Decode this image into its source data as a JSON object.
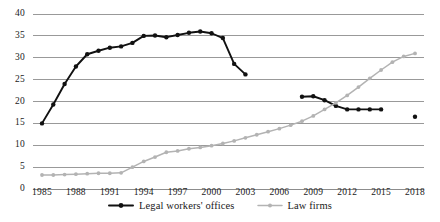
{
  "chart_data": {
    "type": "line",
    "title": "",
    "subtitle": "",
    "xlabel": "",
    "ylabel": "",
    "xlim": [
      1985,
      2018
    ],
    "ylim": [
      0,
      40
    ],
    "grid": "horizontal",
    "legend_position": "bottom-center",
    "y_ticks": [
      0,
      5,
      10,
      15,
      20,
      25,
      30,
      35,
      40
    ],
    "y_tick_labels": [
      "0",
      "5",
      "10",
      "15",
      "20",
      "25",
      "30",
      "35",
      "40"
    ],
    "x_ticks": [
      1985,
      1988,
      1991,
      1994,
      1997,
      2000,
      2003,
      2006,
      2009,
      2012,
      2015,
      2018
    ],
    "x_tick_labels": [
      "1985",
      "1988",
      "1991",
      "1994",
      "1997",
      "2000",
      "2003",
      "2006",
      "2009",
      "2012",
      "2015",
      "2018"
    ],
    "series": [
      {
        "name": "Legal workers' offices",
        "color": "#111111",
        "marker": "circle",
        "segments": [
          {
            "x": [
              1985,
              1986,
              1987,
              1988,
              1989,
              1990,
              1991,
              1992,
              1993,
              1994,
              1995,
              1996,
              1997,
              1998,
              1999,
              2000,
              2001,
              2002,
              2003
            ],
            "y": [
              15.0,
              19.3,
              24.0,
              28.0,
              30.8,
              31.6,
              32.3,
              32.6,
              33.4,
              35.0,
              35.1,
              34.7,
              35.2,
              35.7,
              36.0,
              35.6,
              34.5,
              28.6,
              26.2
            ]
          },
          {
            "x": [
              2008,
              2009,
              2010,
              2011,
              2012,
              2013,
              2014,
              2015
            ],
            "y": [
              21.1,
              21.2,
              20.3,
              19.0,
              18.2,
              18.2,
              18.2,
              18.2
            ]
          },
          {
            "x": [
              2018
            ],
            "y": [
              16.5
            ]
          }
        ]
      },
      {
        "name": "Law firms",
        "color": "#b3b3b3",
        "marker": "circle",
        "segments": [
          {
            "x": [
              1985,
              1986,
              1987,
              1988,
              1989,
              1990,
              1991,
              1992,
              1993,
              1994,
              1995,
              1996,
              1997,
              1998,
              1999,
              2000,
              2001,
              2002,
              2003,
              2004,
              2005,
              2006,
              2007,
              2008,
              2009,
              2010,
              2011,
              2012,
              2013,
              2014,
              2015,
              2016,
              2017,
              2018
            ],
            "y": [
              3.2,
              3.2,
              3.3,
              3.4,
              3.5,
              3.6,
              3.6,
              3.7,
              5.0,
              6.3,
              7.3,
              8.4,
              8.7,
              9.2,
              9.5,
              9.9,
              10.4,
              11.0,
              11.7,
              12.4,
              13.1,
              13.8,
              14.6,
              15.5,
              16.7,
              18.2,
              19.7,
              21.4,
              23.3,
              25.3,
              27.2,
              29.0,
              30.3,
              31.0
            ]
          }
        ]
      }
    ]
  },
  "legend": {
    "items": [
      {
        "label": "Legal workers' offices",
        "color": "#111111"
      },
      {
        "label": "Law firms",
        "color": "#b3b3b3"
      }
    ]
  },
  "colors": {
    "series_black": "#111111",
    "series_gray": "#b3b3b3",
    "gridline": "#808080",
    "text": "#1a1a1a",
    "background": "#ffffff"
  }
}
